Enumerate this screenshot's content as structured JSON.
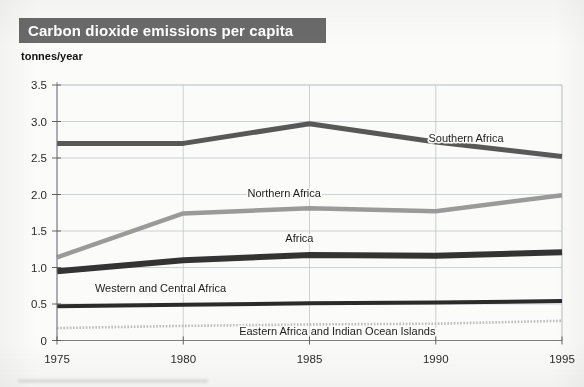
{
  "figure": {
    "title": "Carbon dioxide emissions per capita",
    "unit_label": "tonnes/year",
    "title_bar_color": "#6a6a6a",
    "title_text_color": "#ffffff",
    "background_color": "#fbfbfa",
    "gridline_color": "#b9bfcb"
  },
  "chart_data": {
    "type": "line",
    "title": "Carbon dioxide emissions per capita",
    "xlabel": "",
    "ylabel": "tonnes/year",
    "x": [
      1975,
      1980,
      1985,
      1990,
      1995
    ],
    "xlim": [
      1975,
      1995
    ],
    "ylim": [
      0,
      3.5
    ],
    "xticks": [
      "1975",
      "1980",
      "1985",
      "1990",
      "1995"
    ],
    "yticks": [
      "0",
      "0.5",
      "1.0",
      "1.5",
      "2.0",
      "2.5",
      "3.0",
      "3.5"
    ],
    "ytick_values": [
      0,
      0.5,
      1.0,
      1.5,
      2.0,
      2.5,
      3.0,
      3.5
    ],
    "grid": true,
    "legend": "inline-labels",
    "series": [
      {
        "name": "Southern Africa",
        "values": [
          2.7,
          2.7,
          2.97,
          2.72,
          2.52
        ],
        "color": "#585858",
        "width": 5,
        "style": "solid",
        "label_x": 1991.2,
        "label_y": 2.72
      },
      {
        "name": "Northern Africa",
        "values": [
          1.14,
          1.74,
          1.81,
          1.77,
          1.99
        ],
        "color": "#9a9a9a",
        "width": 4.5,
        "style": "solid",
        "label_x": 1984.0,
        "label_y": 1.97
      },
      {
        "name": "Africa",
        "values": [
          0.95,
          1.1,
          1.17,
          1.16,
          1.21
        ],
        "color": "#333333",
        "width": 6,
        "style": "solid",
        "label_x": 1984.6,
        "label_y": 1.35
      },
      {
        "name": "Western and Central Africa",
        "values": [
          0.47,
          0.49,
          0.51,
          0.52,
          0.54
        ],
        "color": "#2b2b2b",
        "width": 4,
        "style": "solid",
        "label_x": 1979.1,
        "label_y": 0.66
      },
      {
        "name": "Eastern Africa and Indian Ocean Islands",
        "values": [
          0.17,
          0.2,
          0.22,
          0.23,
          0.27
        ],
        "color": "#bdbdbd",
        "width": 2.6,
        "style": "dotted",
        "label_x": 1986.1,
        "label_y": 0.07
      }
    ]
  }
}
